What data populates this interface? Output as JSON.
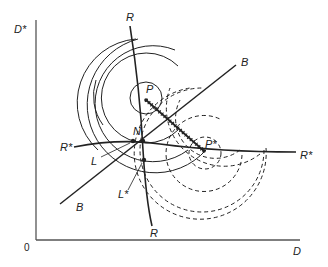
{
  "figure": {
    "type": "economic-diagram",
    "axes": {
      "y_label": "D*",
      "x_label": "D",
      "origin_label": "0"
    },
    "curves": {
      "R": {
        "label_top": "R",
        "label_bottom": "R"
      },
      "R_star": {
        "label_left": "R*",
        "label_right": "R*"
      },
      "B": {
        "label_top": "B",
        "label_bottom": "B"
      }
    },
    "points": {
      "P": "P",
      "P_star": "P*",
      "N": "N",
      "L": "L",
      "L_star": "L*"
    },
    "colors": {
      "line": "#222222",
      "axis": "#555555",
      "background": "#ffffff"
    }
  }
}
